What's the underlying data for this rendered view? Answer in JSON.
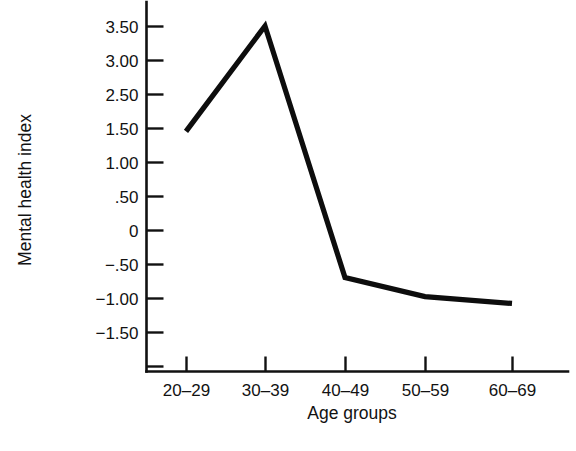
{
  "chart_data": {
    "type": "line",
    "title": "",
    "xlabel": "Age groups",
    "ylabel": "Mental health index",
    "categories": [
      "20–29",
      "30–39",
      "40–49",
      "50–59",
      "60–69"
    ],
    "values": [
      1.45,
      3.5,
      -0.7,
      -0.98,
      -1.08
    ],
    "series": [
      {
        "name": "Mental health index",
        "values": [
          1.45,
          3.5,
          -0.7,
          -0.98,
          -1.08
        ]
      }
    ],
    "y_tick_labels": [
      "3.50",
      "3.00",
      "2.50",
      "1.50",
      "1.00",
      ".50",
      "0",
      "−.50",
      "−1.00",
      "−1.50"
    ],
    "y_tick_values": [
      3.5,
      3.0,
      2.5,
      1.5,
      1.0,
      0.5,
      0,
      -0.5,
      -1.0,
      -1.5
    ],
    "ylim": [
      -1.85,
      3.85
    ],
    "grid": false,
    "legend": false,
    "line_color": "#0d0d0d",
    "axis_color": "#111111",
    "background_color": "#ffffff"
  },
  "axes": {
    "y_title": "Mental health index",
    "x_title": "Age groups"
  },
  "ticks": {
    "y": [
      {
        "label": "3.50",
        "value": 3.5
      },
      {
        "label": "3.00",
        "value": 3.0
      },
      {
        "label": "2.50",
        "value": 2.5
      },
      {
        "label": "1.50",
        "value": 1.5
      },
      {
        "label": "1.00",
        "value": 1.0
      },
      {
        "label": ".50",
        "value": 0.5
      },
      {
        "label": "0",
        "value": 0
      },
      {
        "label": "−.50",
        "value": -0.5
      },
      {
        "label": "−1.00",
        "value": -1.0
      },
      {
        "label": "−1.50",
        "value": -1.5
      }
    ],
    "x": [
      {
        "label": "20–29"
      },
      {
        "label": "30–39"
      },
      {
        "label": "40–49"
      },
      {
        "label": "50–59"
      },
      {
        "label": "60–69"
      }
    ]
  }
}
